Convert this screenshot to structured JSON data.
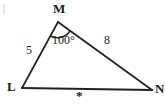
{
  "figure": {
    "vertices": [
      {
        "name": "M",
        "label": "M",
        "x": 58,
        "y": 22
      },
      {
        "name": "L",
        "label": "L",
        "x": 22,
        "y": 88
      },
      {
        "name": "N",
        "label": "N",
        "x": 152,
        "y": 90
      }
    ],
    "sides": [
      {
        "name": "LM",
        "label": "5",
        "from": "L",
        "to": "M"
      },
      {
        "name": "MN",
        "label": "8",
        "from": "M",
        "to": "N"
      },
      {
        "name": "LN",
        "label": "*",
        "from": "L",
        "to": "N"
      }
    ],
    "angles": [
      {
        "name": "angle-M",
        "label": "100°",
        "vertex": "M"
      }
    ],
    "stroke_color": "#222222",
    "background_color": "#fefefe"
  }
}
